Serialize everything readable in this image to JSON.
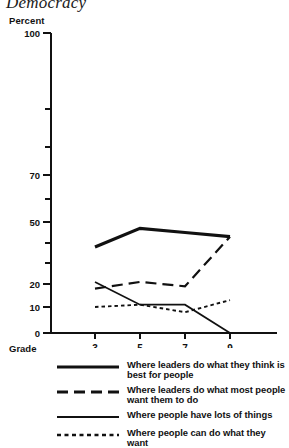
{
  "chart_title": "Democracy",
  "axes": {
    "y_title": "Percent",
    "x_title": "Grade",
    "y_tick_labels": [
      "0",
      "10",
      "20",
      "50",
      "70",
      "100"
    ],
    "x_tick_labels": [
      "3",
      "5",
      "7",
      "9"
    ]
  },
  "legend": {
    "items": [
      {
        "style": "thick-solid",
        "label": "Where leaders do what they think is best for people"
      },
      {
        "style": "long-dash",
        "label": "Where leaders do what most people want them to do"
      },
      {
        "style": "thin-solid",
        "label": "Where people have lots of things"
      },
      {
        "style": "dotted",
        "label": "Where people can do what they want"
      }
    ]
  },
  "chart_data": {
    "type": "line",
    "title": "Democracy",
    "xlabel": "Grade",
    "ylabel": "Percent",
    "x": [
      3,
      5,
      7,
      9
    ],
    "categories": [
      "3",
      "5",
      "7",
      "9"
    ],
    "y_scale": "non-linear (probability scale, compressed at extremes)",
    "ylim": [
      0,
      100
    ],
    "y_ticks": [
      0,
      10,
      20,
      30,
      40,
      50,
      60,
      70,
      80,
      90,
      100
    ],
    "y_labeled_ticks": [
      0,
      10,
      20,
      50,
      70,
      100
    ],
    "grid": false,
    "legend_position": "below",
    "series": [
      {
        "name": "Where leaders do what they think is best for people",
        "style": "thick-solid",
        "values": [
          38,
          47,
          45,
          43
        ]
      },
      {
        "name": "Where leaders do what most people want them to do",
        "style": "long-dash",
        "values": [
          18,
          21,
          19,
          43
        ]
      },
      {
        "name": "Where people have lots of things",
        "style": "thin-solid",
        "values": [
          21,
          11,
          11,
          0
        ]
      },
      {
        "name": "Where people can do what they want",
        "style": "dotted",
        "values": [
          10,
          11,
          8,
          13
        ]
      }
    ]
  }
}
